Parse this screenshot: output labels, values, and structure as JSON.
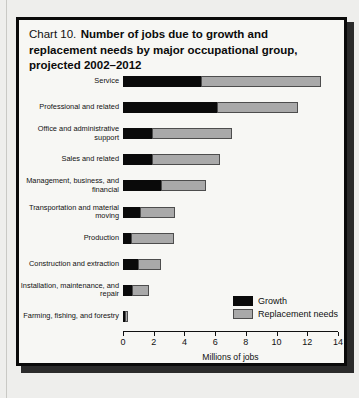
{
  "chart_data": {
    "type": "bar",
    "orientation": "horizontal",
    "stacked": true,
    "title_prefix": "Chart 10.",
    "title": "Number of jobs due to growth and replacement needs by major occupational group, projected 2002–2012",
    "xlabel": "Millions of jobs",
    "ylabel": "",
    "xlim": [
      0,
      14
    ],
    "xticks": [
      0,
      2,
      4,
      6,
      8,
      10,
      12,
      14
    ],
    "xtick_labels": [
      "0",
      "2",
      "4",
      "6",
      "8",
      "10",
      "12",
      "14"
    ],
    "grid": false,
    "legend_position": "inside-right",
    "categories": [
      "Service",
      "Professional and related",
      "Office and administrative support",
      "Sales and related",
      "Management, business, and financial",
      "Transportation and material moving",
      "Production",
      "Construction and extraction",
      "Installation, maintenance, and repair",
      "Farming, fishing, and forestry"
    ],
    "series": [
      {
        "name": "Growth",
        "color": "#0a0a0a",
        "values": [
          5.1,
          6.1,
          1.9,
          1.9,
          2.5,
          1.1,
          0.5,
          1.0,
          0.6,
          0.1
        ]
      },
      {
        "name": "Replacement needs",
        "color": "#a9a9a9",
        "values": [
          7.8,
          5.3,
          5.2,
          4.4,
          2.9,
          2.3,
          2.8,
          1.5,
          1.1,
          0.2
        ]
      }
    ],
    "totals": [
      12.9,
      11.4,
      7.1,
      6.3,
      5.4,
      3.4,
      3.3,
      2.5,
      1.7,
      0.3
    ]
  },
  "legend": {
    "items": [
      {
        "label": "Growth",
        "swatch": "black-swatch-icon"
      },
      {
        "label": "Replacement needs",
        "swatch": "gray-swatch-icon"
      }
    ]
  }
}
